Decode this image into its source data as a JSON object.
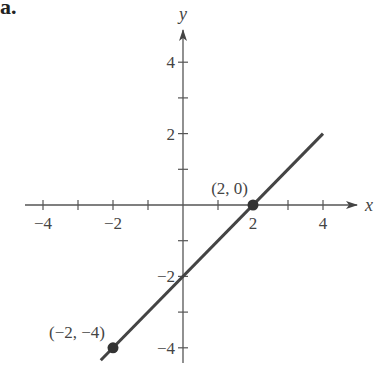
{
  "part_label": "a.",
  "chart_data": {
    "type": "line",
    "title": "",
    "xlabel": "x",
    "ylabel": "y",
    "xlim": [
      -4.2,
      5
    ],
    "ylim": [
      -4.4,
      5
    ],
    "grid": false,
    "x_ticks": [
      -4,
      -3,
      -2,
      -1,
      1,
      2,
      3,
      4
    ],
    "x_tick_labels": [
      {
        "value": -4,
        "label": "−4"
      },
      {
        "value": -2,
        "label": "−2"
      },
      {
        "value": 2,
        "label": "2"
      },
      {
        "value": 4,
        "label": "4"
      }
    ],
    "y_ticks": [
      -4,
      -3,
      -2,
      -1,
      1,
      2,
      3,
      4
    ],
    "y_tick_labels": [
      {
        "value": 4,
        "label": "4"
      },
      {
        "value": 2,
        "label": "2"
      },
      {
        "value": -2,
        "label": "−2"
      },
      {
        "value": -4,
        "label": "−4"
      }
    ],
    "series": [
      {
        "name": "y = x − 2",
        "x": [
          -2.35,
          4
        ],
        "y": [
          -4.35,
          2
        ],
        "color": "#444444"
      }
    ],
    "points": [
      {
        "x": 2,
        "y": 0,
        "label": "(2, 0)"
      },
      {
        "x": -2,
        "y": -4,
        "label": "(−2, −4)"
      }
    ],
    "colors": {
      "axis": "#555555",
      "line": "#444444",
      "point": "#333333",
      "text": "#444444"
    }
  }
}
